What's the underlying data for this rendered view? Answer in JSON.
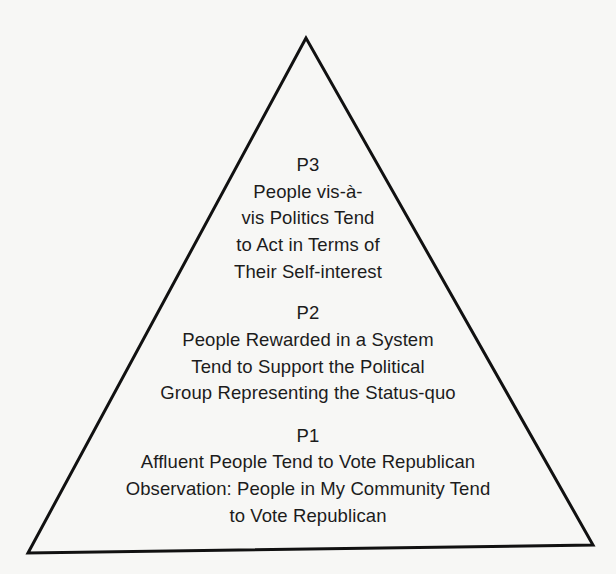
{
  "diagram": {
    "shape": "triangle",
    "stroke_color": "#111111",
    "background_color": "#f7f7f5",
    "vertices": {
      "apex": [
        306,
        38
      ],
      "bottom_left": [
        28,
        553
      ],
      "bottom_right": [
        593,
        545
      ]
    },
    "levels": [
      {
        "id": "P3",
        "label": "P3",
        "lines": [
          "People vis-à-",
          "vis Politics Tend",
          "to Act in Terms of",
          "Their Self-interest"
        ]
      },
      {
        "id": "P2",
        "label": "P2",
        "lines": [
          "People Rewarded in a System",
          "Tend to Support the Political",
          "Group Representing the Status-quo"
        ]
      },
      {
        "id": "P1",
        "label": "P1",
        "lines": [
          "Affluent People Tend to Vote Republican",
          "Observation: People in My Community Tend",
          "to Vote Republican"
        ]
      }
    ]
  }
}
